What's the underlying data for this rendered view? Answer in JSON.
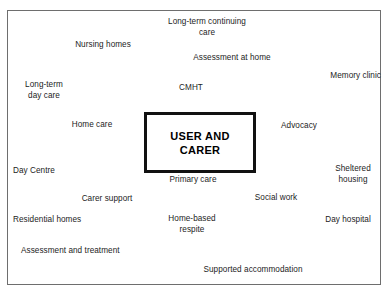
{
  "diagram": {
    "center": {
      "label": "USER AND\nCARER"
    },
    "nodes": [
      {
        "label": "Long-term continuing\ncare",
        "x": 146,
        "y": 16,
        "w": 120,
        "align": "center"
      },
      {
        "label": "Nursing homes",
        "x": 66,
        "y": 39,
        "w": 72,
        "align": "center"
      },
      {
        "label": "Assessment at home",
        "x": 185,
        "y": 52,
        "w": 92,
        "align": "center"
      },
      {
        "label": "Memory clinic",
        "x": 310,
        "y": 70,
        "w": 70,
        "align": "right"
      },
      {
        "label": "Long-term\nday care",
        "x": 14,
        "y": 79,
        "w": 58,
        "align": "center"
      },
      {
        "label": "CMHT",
        "x": 170,
        "y": 82,
        "w": 40,
        "align": "center"
      },
      {
        "label": "Home care",
        "x": 64,
        "y": 119,
        "w": 54,
        "align": "center"
      },
      {
        "label": "Advocacy",
        "x": 272,
        "y": 120,
        "w": 52,
        "align": "center"
      },
      {
        "label": "Day Centre",
        "x": 12,
        "y": 165,
        "w": 58,
        "align": "left"
      },
      {
        "label": "Sheltered\nhousing",
        "x": 324,
        "y": 163,
        "w": 56,
        "align": "center"
      },
      {
        "label": "Primary care",
        "x": 159,
        "y": 174,
        "w": 66,
        "align": "center"
      },
      {
        "label": "Social work",
        "x": 245,
        "y": 192,
        "w": 60,
        "align": "center"
      },
      {
        "label": "Carer support",
        "x": 76,
        "y": 193,
        "w": 60,
        "align": "center"
      },
      {
        "label": "Residential homes",
        "x": 12,
        "y": 214,
        "w": 84,
        "align": "left"
      },
      {
        "label": "Home-based\nrespite",
        "x": 160,
        "y": 213,
        "w": 62,
        "align": "center"
      },
      {
        "label": "Day hospital",
        "x": 316,
        "y": 214,
        "w": 62,
        "align": "center"
      },
      {
        "label": "Assessment and treatment",
        "x": 20,
        "y": 245,
        "w": 122,
        "align": "left"
      },
      {
        "label": "Supported accommodation",
        "x": 190,
        "y": 264,
        "w": 124,
        "align": "center"
      }
    ]
  }
}
